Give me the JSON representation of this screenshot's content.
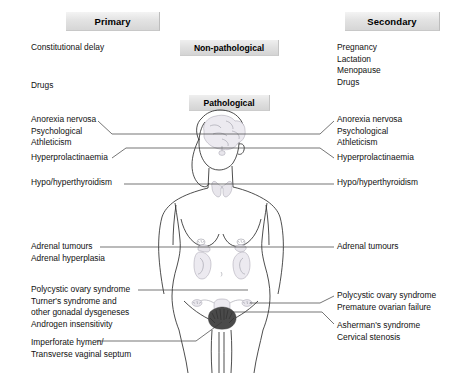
{
  "diagram": {
    "title_implied": "Causes of amenorrhoea",
    "headers": {
      "primary": "Primary",
      "secondary": "Secondary"
    },
    "categories": {
      "non_pathological": "Non-pathological",
      "pathological": "Pathological"
    },
    "left_column": {
      "non_pathological": [
        {
          "id": "constitutional-delay",
          "text": "Constitutional delay"
        },
        {
          "id": "drugs",
          "text": "Drugs"
        }
      ],
      "pathological_groups": [
        {
          "id": "hypothalamic-group",
          "lines": [
            "Anorexia nervosa",
            "Psychological",
            "Athleticism"
          ]
        },
        {
          "id": "pituitary-group",
          "lines": [
            "Hyperprolactinaemia"
          ]
        },
        {
          "id": "thyroid-group",
          "lines": [
            "Hypo/hyperthyroidism"
          ]
        },
        {
          "id": "adrenal-group",
          "lines": [
            "Adrenal tumours",
            "Adrenal hyperplasia"
          ]
        },
        {
          "id": "ovarian-group",
          "lines": [
            "Polycystic ovary syndrome",
            "Turner's syndrome and",
            "other gonadal dysgeneses",
            "Androgen insensitivity"
          ]
        },
        {
          "id": "outflow-tract-group",
          "lines": [
            "Imperforate hymen/",
            "Transverse vaginal septum"
          ]
        }
      ]
    },
    "right_column": {
      "non_pathological": [
        {
          "id": "pregnancy",
          "text": "Pregnancy"
        },
        {
          "id": "lactation",
          "text": "Lactation"
        },
        {
          "id": "menopause",
          "text": "Menopause"
        },
        {
          "id": "drugs",
          "text": "Drugs"
        }
      ],
      "pathological_groups": [
        {
          "id": "hypothalamic-group",
          "lines": [
            "Anorexia nervosa",
            "Psychological",
            "Athleticism"
          ]
        },
        {
          "id": "pituitary-group",
          "lines": [
            "Hyperprolactinaemia"
          ]
        },
        {
          "id": "thyroid-group",
          "lines": [
            "Hypo/hyperthyroidism"
          ]
        },
        {
          "id": "adrenal-group",
          "lines": [
            "Adrenal tumours"
          ]
        },
        {
          "id": "ovarian-group",
          "lines": [
            "Polycystic ovary syndrome",
            "Premature ovarian failure"
          ]
        },
        {
          "id": "uterine-group",
          "lines": [
            "Asherman's syndrome",
            "Cervical stenosis"
          ]
        }
      ]
    },
    "figure": {
      "description": "anatomical front view of female body with brain, thyroid, breasts, adrenal glands with kidneys, uterus and ovaries highlighted",
      "organs": [
        "brain",
        "pituitary",
        "thyroid",
        "breasts",
        "adrenal-glands",
        "kidneys",
        "uterus",
        "ovaries",
        "vagina"
      ]
    },
    "colors": {
      "box_fill": "#e0e0e0",
      "box_edge": "#c4c4c4",
      "text": "#111111",
      "leader_line": "#3a3a3a",
      "body_outline": "#2e2e2e",
      "organ_tint": "#eceaf0"
    }
  }
}
